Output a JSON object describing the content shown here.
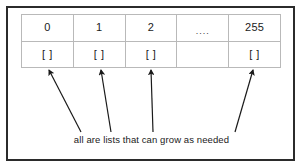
{
  "diagram": {
    "outer_frame": {
      "border_color": "#2b2b2b"
    },
    "table": {
      "border_color": "#b9b9b9",
      "index_row": {
        "name": "index-row",
        "cells": [
          {
            "label": "0"
          },
          {
            "label": "1"
          },
          {
            "label": "2"
          },
          {
            "label": "...."
          },
          {
            "label": "255"
          }
        ]
      },
      "bucket_row": {
        "name": "bucket-row",
        "cells": [
          {
            "label": "[ ]"
          },
          {
            "label": "[ ]"
          },
          {
            "label": "[ ]"
          },
          {
            "label": ""
          },
          {
            "label": "[ ]"
          }
        ]
      }
    },
    "arrows": {
      "color": "#1a1a1a",
      "count": 4,
      "targets": [
        "0",
        "1",
        "2",
        "255"
      ]
    },
    "caption": "all are lists that can grow as needed"
  }
}
